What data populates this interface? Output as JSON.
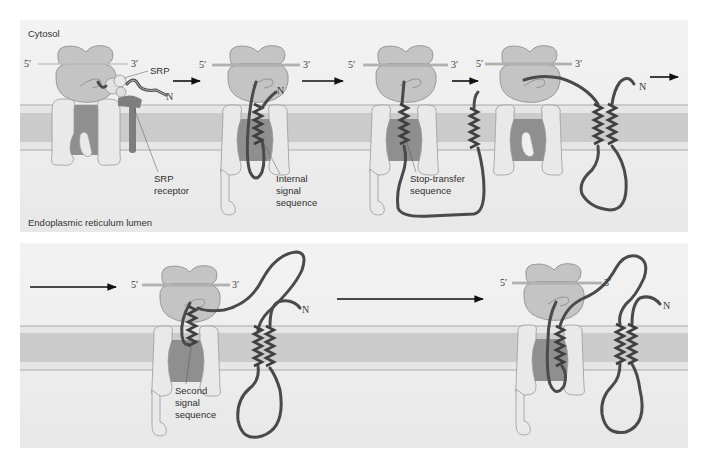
{
  "figure": {
    "colors": {
      "panel_bg": "#eeeeee",
      "membrane_outer": "#e4e4e4",
      "membrane_core": "#cccccc",
      "membrane_line": "#9a9a9a",
      "ribosome": "#c4c4c4",
      "translocon_light": "#e9e9e9",
      "translocon_dark": "#8f8f8f",
      "polypeptide": "#4a4a4a",
      "arrow": "#111111"
    }
  },
  "regions": {
    "cytosol": "Cytosol",
    "lumen": "Endoplasmic reticulum lumen"
  },
  "top_panel": {
    "steps": [
      {
        "five_prime": "5′",
        "three_prime": "3′",
        "n_terminus": "N",
        "labels": {
          "srp": "SRP",
          "srp_receptor_line1": "SRP",
          "srp_receptor_line2": "receptor"
        }
      },
      {
        "five_prime": "5′",
        "three_prime": "3′",
        "n_terminus": "N",
        "labels": {
          "line1": "Internal",
          "line2": "signal",
          "line3": "sequence"
        }
      },
      {
        "five_prime": "5′",
        "three_prime": "3′",
        "labels": {
          "line1": "Stop-transfer",
          "line2": "sequence"
        }
      },
      {
        "five_prime": "5′",
        "three_prime": "3′",
        "n_terminus": "N"
      }
    ]
  },
  "bottom_panel": {
    "steps": [
      {
        "five_prime": "5′",
        "three_prime": "3′",
        "n_terminus": "N",
        "labels": {
          "line1": "Second",
          "line2": "signal",
          "line3": "sequence"
        }
      },
      {
        "five_prime": "5′",
        "three_prime": "3′",
        "n_terminus": "N"
      }
    ]
  },
  "arrows": {
    "count": 6,
    "icon": "right-arrow-icon"
  }
}
